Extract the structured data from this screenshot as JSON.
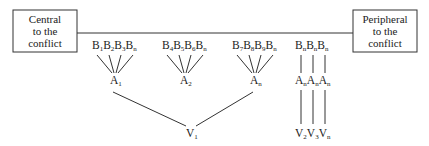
{
  "diagram": {
    "left_box": {
      "lines": [
        "Central",
        "to the",
        "conflict"
      ]
    },
    "right_box": {
      "lines": [
        "Peripheral",
        "to the",
        "conflict"
      ]
    },
    "groups": [
      {
        "b_labels": [
          [
            "B",
            "1"
          ],
          [
            "B",
            "2"
          ],
          [
            "B",
            "3"
          ],
          [
            "B",
            "n"
          ]
        ],
        "a_label": [
          "A",
          "1"
        ]
      },
      {
        "b_labels": [
          [
            "B",
            "4"
          ],
          [
            "B",
            "5"
          ],
          [
            "B",
            "6"
          ],
          [
            "B",
            "n"
          ]
        ],
        "a_label": [
          "A",
          "2"
        ]
      },
      {
        "b_labels": [
          [
            "B",
            "7"
          ],
          [
            "B",
            "8"
          ],
          [
            "B",
            "9"
          ],
          [
            "B",
            "n"
          ]
        ],
        "a_label": [
          "A",
          "n"
        ]
      }
    ],
    "v_shared": [
      "V",
      "1"
    ],
    "chains": [
      {
        "b": [
          "B",
          "n"
        ],
        "a": [
          "A",
          "n"
        ],
        "v": [
          "V",
          "2"
        ]
      },
      {
        "b": [
          "B",
          "n"
        ],
        "a": [
          "A",
          "n"
        ],
        "v": [
          "V",
          "3"
        ]
      },
      {
        "b": [
          "B",
          "n"
        ],
        "a": [
          "A",
          "n"
        ],
        "v": [
          "V",
          "n"
        ]
      }
    ]
  }
}
